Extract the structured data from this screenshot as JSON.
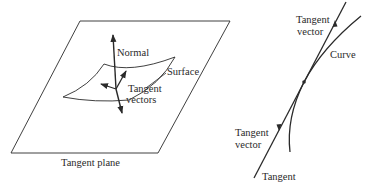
{
  "left_diagram": {
    "labels": {
      "normal": "Normal",
      "surface": "Surface",
      "tangent_vectors_line1": "Tangent",
      "tangent_vectors_line2": "vectors",
      "tangent_plane": "Tangent plane"
    }
  },
  "right_diagram": {
    "labels": {
      "upper_tangent_vector_line1": "Tangent",
      "upper_tangent_vector_line2": "vector",
      "curve": "Curve",
      "lower_tangent_vector_line1": "Tangent",
      "lower_tangent_vector_line2": "vector",
      "tangent": "Tangent"
    }
  },
  "colors": {
    "ink": "#2a2a2a",
    "background": "#ffffff"
  }
}
